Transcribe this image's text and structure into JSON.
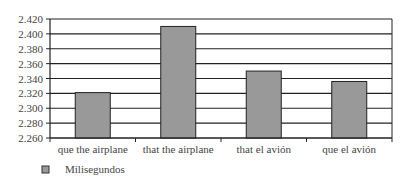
{
  "chart_data": {
    "type": "bar",
    "title": "",
    "xlabel": "",
    "ylabel": "",
    "categories": [
      "que the airplane",
      "that the airplane",
      "that el avión",
      "que el avión"
    ],
    "series": [
      {
        "name": "Milisegundos",
        "values": [
          2.321,
          2.41,
          2.35,
          2.336
        ],
        "color": "#999999"
      }
    ],
    "ylim": [
      2.26,
      2.42
    ],
    "yticks": [
      "2.420",
      "2.400",
      "2.380",
      "2.360",
      "2.340",
      "2.320",
      "2.300",
      "2.280",
      "2.260"
    ],
    "grid": true,
    "legend_position": "bottom-left"
  },
  "legend": {
    "label": "Milisegundos"
  }
}
